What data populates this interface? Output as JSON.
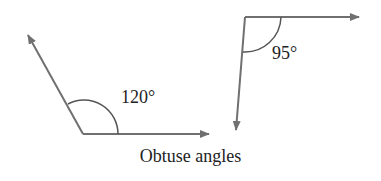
{
  "diagram": {
    "caption": "Obtuse angles",
    "line_color": "#707070",
    "angles": [
      {
        "label": "120°",
        "measure": 120
      },
      {
        "label": "95°",
        "measure": 95
      }
    ]
  }
}
